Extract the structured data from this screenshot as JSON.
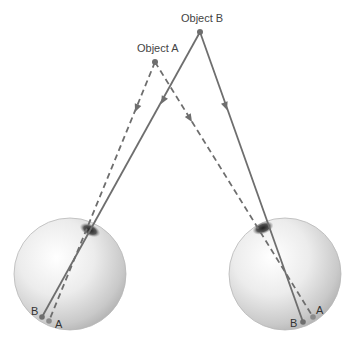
{
  "objects": [
    {
      "name": "Object A",
      "label": "Object A",
      "x": 155,
      "y": 62
    },
    {
      "name": "Object B",
      "label": "Object B",
      "x": 200,
      "y": 32
    }
  ],
  "eyes": [
    {
      "name": "left-eye",
      "cx": 70,
      "cy": 274,
      "r": 56,
      "pupil": {
        "x": 90,
        "y": 230
      },
      "retina_points": [
        {
          "label": "B",
          "x": 42,
          "y": 317
        },
        {
          "label": "A",
          "x": 49,
          "y": 321
        }
      ]
    },
    {
      "name": "right-eye",
      "cx": 285,
      "cy": 274,
      "r": 56,
      "pupil": {
        "x": 263,
        "y": 228
      },
      "retina_points": [
        {
          "label": "B",
          "x": 303,
          "y": 322
        },
        {
          "label": "A",
          "x": 313,
          "y": 317
        }
      ]
    }
  ],
  "rays": {
    "object_a_style": "dashed",
    "object_b_style": "solid",
    "color": "#6e6e6e"
  },
  "labels": {
    "object_a": "Object A",
    "object_b": "Object B",
    "left_b": "B",
    "left_a": "A",
    "right_b": "B",
    "right_a": "A"
  }
}
